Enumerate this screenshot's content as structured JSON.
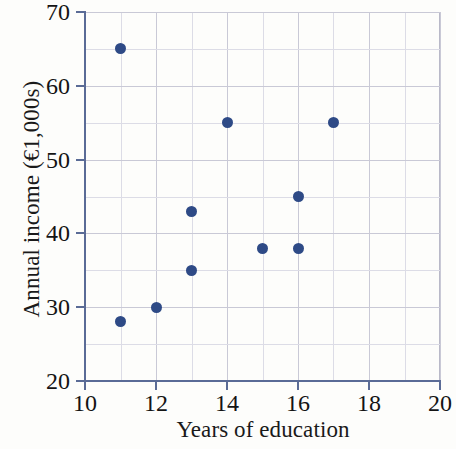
{
  "chart_data": {
    "type": "scatter",
    "title": "",
    "xlabel": "Years of education",
    "ylabel": "Annual income (€1,000s)",
    "xlim": [
      10,
      20
    ],
    "ylim": [
      20,
      70
    ],
    "x_tick_labels": [
      "10",
      "12",
      "14",
      "16",
      "18",
      "20"
    ],
    "x_tick_values": [
      10,
      12,
      14,
      16,
      18,
      20
    ],
    "y_tick_labels": [
      "20",
      "30",
      "40",
      "50",
      "60",
      "70"
    ],
    "y_tick_values": [
      20,
      30,
      40,
      50,
      60,
      70
    ],
    "x_gridline_values": [
      10,
      11,
      12,
      13,
      14,
      15,
      16,
      17,
      18,
      19,
      20
    ],
    "y_gridline_values": [
      20,
      25,
      30,
      35,
      40,
      45,
      50,
      55,
      60,
      65,
      70
    ],
    "grid": true,
    "legend": false,
    "marker_color": "#2e4a86",
    "axis_color": "#5a6b96",
    "grid_color": "#c9c9d6",
    "points": [
      {
        "x": 11,
        "y": 65
      },
      {
        "x": 11,
        "y": 28
      },
      {
        "x": 12,
        "y": 30
      },
      {
        "x": 13,
        "y": 43
      },
      {
        "x": 13,
        "y": 35
      },
      {
        "x": 14,
        "y": 55
      },
      {
        "x": 15,
        "y": 38
      },
      {
        "x": 16,
        "y": 45
      },
      {
        "x": 16,
        "y": 38
      },
      {
        "x": 17,
        "y": 55
      }
    ]
  }
}
